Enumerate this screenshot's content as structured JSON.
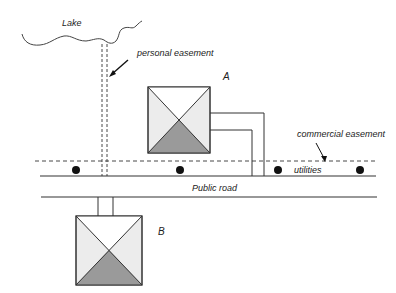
{
  "labels": {
    "lake": "Lake",
    "personal_easement": "personal easement",
    "house_a": "A",
    "house_b": "B",
    "commercial_easement": "commercial easement",
    "utilities": "utilities",
    "public_road": "Public road"
  },
  "colors": {
    "line": "#333333",
    "house_light": "#ececec",
    "house_white": "#ffffff",
    "house_dark": "#9a9a9a"
  }
}
